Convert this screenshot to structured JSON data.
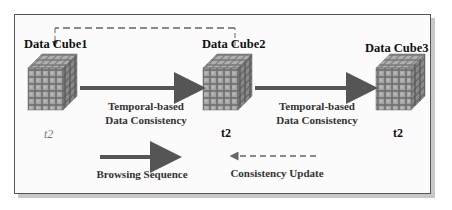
{
  "diagram": {
    "nodes": [
      {
        "id": "cube1",
        "label": "Data Cube1",
        "time": "t2",
        "time_style": "italic-gray"
      },
      {
        "id": "cube2",
        "label": "Data Cube2",
        "time": "t2",
        "time_style": "bold"
      },
      {
        "id": "cube3",
        "label": "Data Cube3",
        "time": "t2",
        "time_style": "bold"
      }
    ],
    "edges": [
      {
        "from": "cube1",
        "to": "cube2",
        "style": "solid",
        "label_line1": "Temporal-based",
        "label_line2": "Data Consistency"
      },
      {
        "from": "cube2",
        "to": "cube3",
        "style": "solid",
        "label_line1": "Temporal-based",
        "label_line2": "Data Consistency"
      },
      {
        "from": "cube2",
        "to": "cube1",
        "style": "dashed",
        "label": ""
      }
    ],
    "legend": {
      "browsing": {
        "label": "Browsing Sequence",
        "style": "solid-arrow"
      },
      "update": {
        "label": "Consistency Update",
        "style": "dashed-arrow"
      }
    },
    "colors": {
      "arrow": "#555555",
      "dashed": "#666666",
      "cube_face": "#8c8c8c",
      "frame_border": "#555555",
      "shadow": "#c8c8c8"
    }
  }
}
